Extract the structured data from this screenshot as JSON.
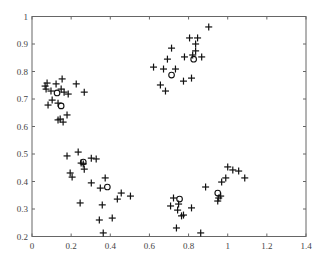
{
  "chart_data": {
    "type": "scatter",
    "title": "",
    "xlabel": "",
    "ylabel": "",
    "xlim": [
      0,
      1.4
    ],
    "ylim": [
      0.2,
      1.0
    ],
    "xticks": [
      0,
      0.2,
      0.4,
      0.6,
      0.8,
      1.0,
      1.2,
      1.4
    ],
    "xtick_labels": [
      "0",
      "0.2",
      "0.4",
      "0.6",
      "0.8",
      "1",
      "1.2",
      "1.4"
    ],
    "yticks": [
      0.2,
      0.3,
      0.4,
      0.5,
      0.6,
      0.7,
      0.8,
      0.9,
      1.0
    ],
    "ytick_labels": [
      "0.2",
      "0.3",
      "0.4",
      "0.5",
      "0.6",
      "0.7",
      "0.8",
      "0.9",
      "1"
    ],
    "grid": false,
    "legend": null,
    "series": [
      {
        "name": "data points",
        "marker": "+",
        "points": [
          [
            0.077,
            0.758
          ],
          [
            0.067,
            0.747
          ],
          [
            0.072,
            0.736
          ],
          [
            0.097,
            0.729
          ],
          [
            0.123,
            0.755
          ],
          [
            0.154,
            0.773
          ],
          [
            0.149,
            0.736
          ],
          [
            0.164,
            0.725
          ],
          [
            0.185,
            0.718
          ],
          [
            0.226,
            0.755
          ],
          [
            0.267,
            0.725
          ],
          [
            0.103,
            0.696
          ],
          [
            0.082,
            0.678
          ],
          [
            0.133,
            0.685
          ],
          [
            0.133,
            0.624
          ],
          [
            0.144,
            0.627
          ],
          [
            0.179,
            0.642
          ],
          [
            0.159,
            0.616
          ],
          [
            0.903,
            0.962
          ],
          [
            0.805,
            0.922
          ],
          [
            0.846,
            0.922
          ],
          [
            0.836,
            0.9
          ],
          [
            0.713,
            0.885
          ],
          [
            0.836,
            0.875
          ],
          [
            0.692,
            0.845
          ],
          [
            0.779,
            0.853
          ],
          [
            0.821,
            0.86
          ],
          [
            0.867,
            0.853
          ],
          [
            0.672,
            0.809
          ],
          [
            0.733,
            0.809
          ],
          [
            0.774,
            0.765
          ],
          [
            0.815,
            0.776
          ],
          [
            0.621,
            0.816
          ],
          [
            0.656,
            0.751
          ],
          [
            0.682,
            0.729
          ],
          [
            0.179,
            0.493
          ],
          [
            0.236,
            0.507
          ],
          [
            0.251,
            0.467
          ],
          [
            0.262,
            0.464
          ],
          [
            0.267,
            0.445
          ],
          [
            0.303,
            0.485
          ],
          [
            0.328,
            0.482
          ],
          [
            0.195,
            0.431
          ],
          [
            0.205,
            0.416
          ],
          [
            0.303,
            0.395
          ],
          [
            0.374,
            0.413
          ],
          [
            0.349,
            0.376
          ],
          [
            0.456,
            0.358
          ],
          [
            0.503,
            0.347
          ],
          [
            0.436,
            0.336
          ],
          [
            0.246,
            0.322
          ],
          [
            0.359,
            0.315
          ],
          [
            0.41,
            0.267
          ],
          [
            0.344,
            0.26
          ],
          [
            0.364,
            0.213
          ],
          [
            0.723,
            0.34
          ],
          [
            0.708,
            0.311
          ],
          [
            0.749,
            0.318
          ],
          [
            0.744,
            0.296
          ],
          [
            0.764,
            0.275
          ],
          [
            0.774,
            0.278
          ],
          [
            0.815,
            0.304
          ],
          [
            0.738,
            0.231
          ],
          [
            0.862,
            0.213
          ],
          [
            1.0,
            0.453
          ],
          [
            1.026,
            0.442
          ],
          [
            1.056,
            0.438
          ],
          [
            1.087,
            0.413
          ],
          [
            0.99,
            0.413
          ],
          [
            0.969,
            0.398
          ],
          [
            0.887,
            0.38
          ],
          [
            0.964,
            0.347
          ],
          [
            0.954,
            0.34
          ],
          [
            0.949,
            0.329
          ]
        ]
      },
      {
        "name": "centers",
        "marker": "o",
        "points": [
          [
            0.128,
            0.722
          ],
          [
            0.149,
            0.675
          ],
          [
            0.826,
            0.845
          ],
          [
            0.713,
            0.787
          ],
          [
            0.262,
            0.471
          ],
          [
            0.385,
            0.38
          ],
          [
            0.754,
            0.336
          ],
          [
            0.949,
            0.358
          ]
        ]
      }
    ]
  }
}
